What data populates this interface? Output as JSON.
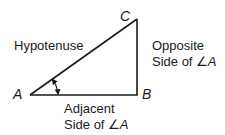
{
  "diagram": {
    "type": "right-triangle",
    "stroke_color": "#1a1a1a",
    "vertices": {
      "A": {
        "label": "A",
        "x": 30,
        "y": 95
      },
      "B": {
        "label": "B",
        "x": 137,
        "y": 95
      },
      "C": {
        "label": "C",
        "x": 137,
        "y": 19
      }
    },
    "sides": {
      "hypotenuse": {
        "label": "Hypotenuse",
        "from": "A",
        "to": "C"
      },
      "opposite": {
        "line1": "Opposite",
        "line2_prefix": "Side of ",
        "angle_symbol": "∠",
        "angle_name": "A",
        "from": "B",
        "to": "C"
      },
      "adjacent": {
        "line1": "Adjacent",
        "line2_prefix": "Side of ",
        "angle_symbol": "∠",
        "angle_name": "A",
        "from": "A",
        "to": "B"
      }
    },
    "angle_marker": {
      "at": "A",
      "style": "double-arrow-arc",
      "radius": 28
    }
  }
}
